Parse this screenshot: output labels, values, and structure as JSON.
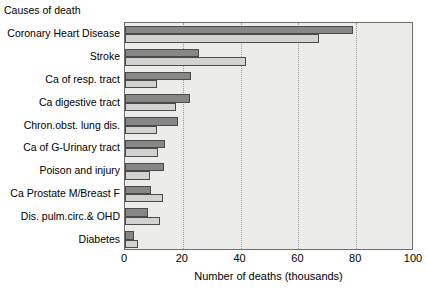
{
  "chart_data": {
    "type": "bar",
    "orientation": "horizontal",
    "title": "",
    "category_axis_title": "Causes of death",
    "xlabel": "Number of deaths (thousands)",
    "ylabel": "",
    "xlim": [
      0,
      100
    ],
    "xticks": [
      0,
      20,
      40,
      60,
      80,
      100
    ],
    "grid": true,
    "grid_axis": "x",
    "grid_style": "dotted",
    "legend": false,
    "legend_position": "none",
    "categories": [
      "Coronary Heart Disease",
      "Stroke",
      "Ca of resp. tract",
      "Ca digestive tract",
      "Chron.obst. lung dis.",
      "Ca of G-Urinary tract",
      "Poison and injury",
      "Ca Prostate M/Breast F",
      "Dis. pulm.circ.& OHD",
      "Diabetes"
    ],
    "series": [
      {
        "name": "series-1",
        "color": "#878787",
        "values": [
          79,
          25.5,
          23,
          22.5,
          18.5,
          14,
          13.5,
          9,
          8,
          3
        ]
      },
      {
        "name": "series-2",
        "color": "#d2d2d1",
        "values": [
          67,
          42,
          11,
          17.5,
          11,
          11.5,
          8.5,
          13,
          12,
          4.5
        ]
      }
    ],
    "colors": {
      "plot_background": "#ececeb",
      "frame": "#6e6e6e",
      "bar_edge": "#4a4a4a",
      "gridline": "#9a9a9a",
      "text": "#000000",
      "page_background": "#ffffff"
    }
  }
}
